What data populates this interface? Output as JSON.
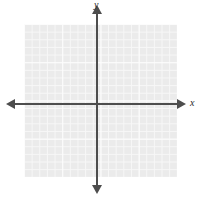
{
  "figure": {
    "kind": "blank-cartesian-coordinate-plane",
    "width": 203,
    "height": 198,
    "background_color": "#ffffff"
  },
  "axes": {
    "x_label": "x",
    "y_label": "y",
    "axis_color": "#4d4d4d",
    "origin": {
      "x": 97,
      "y": 104
    },
    "x_arrow_left": "arrow-left",
    "x_arrow_right": "arrow-right",
    "y_arrow_top": "arrow-up",
    "y_arrow_bottom": "arrow-down",
    "tick_labels_x": [],
    "tick_labels_y": []
  },
  "grid": {
    "fill_color": "#ebebeb",
    "line_color": "#f7f7f7",
    "major_line_color": "#fcfcfc",
    "cell_size_px": 7.65,
    "columns": 20,
    "rows": 20,
    "left": 24,
    "top": 24,
    "width": 153,
    "height": 153
  },
  "chart_data": {
    "type": "scatter",
    "title": "",
    "subtitle": "",
    "xlabel": "x",
    "ylabel": "y",
    "xlim": [
      -10,
      10
    ],
    "ylim": [
      -10,
      10
    ],
    "xticks": [],
    "yticks": [],
    "grid": true,
    "legend": null,
    "series": [],
    "annotations": [],
    "note": "Empty graph-paper coordinate plane: no plotted data points, curves, or numeric tick labels are rendered."
  }
}
